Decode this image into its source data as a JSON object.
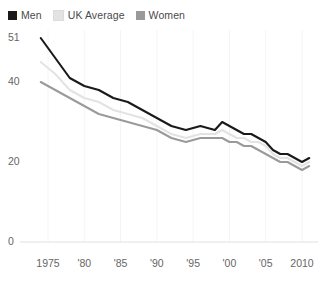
{
  "legend": {
    "position": "top-left",
    "items": [
      {
        "label": "Men",
        "color": "#1a1a1a",
        "swatch_name": "legend-swatch-men"
      },
      {
        "label": "UK Average",
        "color": "#e3e3e3",
        "swatch_name": "legend-swatch-uk-average"
      },
      {
        "label": "Women",
        "color": "#9a9a9a",
        "swatch_name": "legend-swatch-women"
      }
    ]
  },
  "axes": {
    "y_ticks": [
      "51",
      "40",
      "20",
      "0"
    ],
    "y_tick_values": [
      51,
      40,
      20,
      0
    ],
    "x_ticks": [
      "1975",
      "'80",
      "'85",
      "'90",
      "'95",
      "'00",
      "'05",
      "2010"
    ],
    "x_tick_values": [
      1975,
      1980,
      1985,
      1990,
      1995,
      2000,
      2005,
      2010
    ]
  },
  "chart_data": {
    "type": "line",
    "title": "",
    "subtitle": "",
    "xlabel": "",
    "ylabel": "",
    "xlim": [
      1974,
      2011
    ],
    "ylim": [
      0,
      51
    ],
    "grid": "vertical-faint",
    "legend_position": "top-left",
    "x": [
      1974,
      1976,
      1978,
      1980,
      1982,
      1984,
      1986,
      1988,
      1990,
      1992,
      1994,
      1996,
      1998,
      1999,
      2000,
      2001,
      2002,
      2003,
      2004,
      2005,
      2006,
      2007,
      2008,
      2009,
      2010,
      2011
    ],
    "series": [
      {
        "name": "Men",
        "color": "#1a1a1a",
        "values": [
          51,
          46,
          41,
          39,
          38,
          36,
          35,
          33,
          31,
          29,
          28,
          29,
          28,
          30,
          29,
          28,
          27,
          27,
          26,
          25,
          23,
          22,
          22,
          21,
          20,
          21
        ]
      },
      {
        "name": "UK Average",
        "color": "#e3e3e3",
        "values": [
          45,
          42,
          38,
          36,
          35,
          33,
          32,
          31,
          29,
          27,
          26,
          27,
          27,
          28,
          27,
          26,
          26,
          25,
          25,
          24,
          22,
          21,
          21,
          20,
          19,
          20
        ]
      },
      {
        "name": "Women",
        "color": "#9a9a9a",
        "values": [
          40,
          38,
          36,
          34,
          32,
          31,
          30,
          29,
          28,
          26,
          25,
          26,
          26,
          26,
          25,
          25,
          24,
          24,
          23,
          22,
          21,
          20,
          20,
          19,
          18,
          19
        ]
      }
    ]
  }
}
